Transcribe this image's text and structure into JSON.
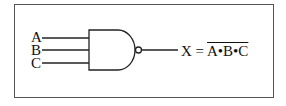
{
  "diagram": {
    "type": "logic-gate",
    "gate": "NAND",
    "inputs": [
      "A",
      "B",
      "C"
    ],
    "output": {
      "lhs": "X",
      "eq": "=",
      "rhs": "A•B•C"
    }
  }
}
